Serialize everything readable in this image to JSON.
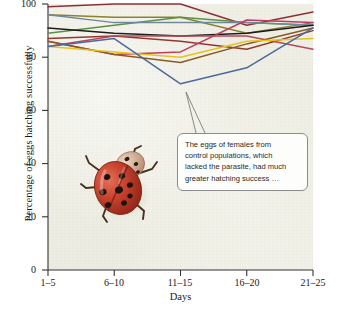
{
  "chart_data": {
    "type": "line",
    "title": "",
    "xlabel": "Days",
    "ylabel": "Percentage of eggs hatching successfully",
    "categories": [
      "1–5",
      "6–10",
      "11–15",
      "16–20",
      "21–25"
    ],
    "ylim": [
      0,
      100
    ],
    "yticks": [
      0,
      20,
      40,
      60,
      80,
      100
    ],
    "grid": false,
    "legend": "none",
    "series": [
      {
        "name": "line-maroon-top",
        "color": "#8c3038",
        "values": [
          99,
          100,
          100,
          92,
          97
        ]
      },
      {
        "name": "line-olive",
        "color": "#8a8230",
        "values": [
          96,
          95,
          95,
          89,
          93
        ]
      },
      {
        "name": "line-green",
        "color": "#5f8f45",
        "values": [
          89,
          92,
          95,
          93,
          92
        ]
      },
      {
        "name": "line-steel",
        "color": "#6f8a9c",
        "values": [
          96,
          93,
          93,
          93,
          92
        ]
      },
      {
        "name": "line-black",
        "color": "#1c1c1c",
        "values": [
          91,
          89,
          88,
          89,
          92
        ]
      },
      {
        "name": "line-darkred",
        "color": "#8e3b2e",
        "values": [
          87,
          88,
          86,
          83,
          90
        ]
      },
      {
        "name": "line-crimson",
        "color": "#c23a5c",
        "values": [
          86,
          81,
          82,
          94,
          93
        ]
      },
      {
        "name": "line-rose",
        "color": "#b8485a",
        "values": [
          84,
          88,
          88,
          88,
          83
        ]
      },
      {
        "name": "line-brown",
        "color": "#8a5a22",
        "values": [
          86,
          81,
          78,
          85,
          91
        ]
      },
      {
        "name": "line-yellow",
        "color": "#e8c21c",
        "values": [
          84,
          82,
          80,
          86,
          87
        ]
      },
      {
        "name": "line-blue",
        "color": "#4a6a9c",
        "values": [
          84,
          87,
          70,
          76,
          91
        ]
      }
    ]
  },
  "axes": {
    "y_title": "Percentage of eggs hatching successfully",
    "x_title": "Days",
    "y_tick_labels": [
      "100",
      "80",
      "60",
      "40",
      "20",
      "0"
    ],
    "x_tick_labels": [
      "1–5",
      "6–10",
      "11–15",
      "16–20",
      "21–25"
    ]
  },
  "callout": {
    "lines": [
      "The eggs of females from",
      "control populations, which",
      "lacked the parasite, had much",
      "greater hatching success …"
    ],
    "text": "The eggs of females from control populations, which lacked the parasite, had much greater hatching success …"
  },
  "photo": {
    "subject": "ladybird-beetle",
    "alt": "Ladybird beetle (ladybug) photograph inside plot area"
  },
  "colors": {
    "plot_background": "#eeeee4",
    "axis": "#333333",
    "callout_border": "#8d8d8d",
    "callout_fill": "#fdfdfb"
  }
}
